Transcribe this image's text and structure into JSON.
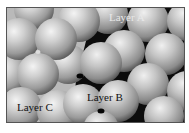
{
  "figure": {
    "labels": {
      "layer_a": "Layer A",
      "layer_b": "Layer B",
      "layer_c": "Layer C"
    },
    "colors": {
      "sphere_highlight": "#f2f2f2",
      "sphere_mid": "#a8a8a8",
      "sphere_shadow": "#5a5a5a",
      "void_dark": "#0a0a0a",
      "void_light": "#c8c8c8",
      "frame": "#555555",
      "background": "#ffffff"
    }
  }
}
